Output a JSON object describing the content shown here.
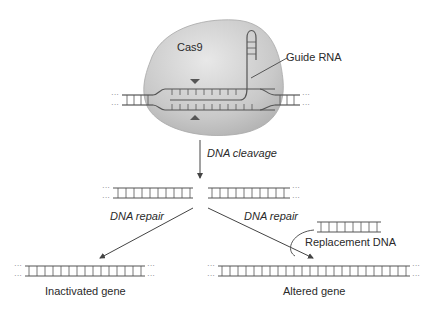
{
  "labels": {
    "cas9": "Cas9",
    "guide_rna": "Guide RNA",
    "dna_cleavage": "DNA cleavage",
    "dna_repair_left": "DNA repair",
    "dna_repair_right": "DNA repair",
    "replacement_dna": "Replacement DNA",
    "inactivated_gene": "Inactivated gene",
    "altered_gene": "Altered gene"
  },
  "colors": {
    "protein_fill": "#c8c8c8",
    "protein_highlight": "#e6e6e6",
    "strand": "#555555",
    "marker": "#555555",
    "text": "#2a2a2a"
  }
}
